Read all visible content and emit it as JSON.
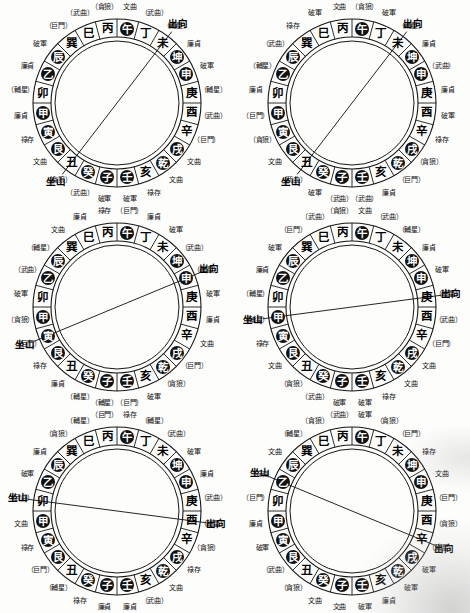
{
  "document": {
    "title": "二十四山九星圖",
    "description": "六個羅盤二十四山九星配置圖"
  },
  "glyphs": {
    "mountains": [
      "壬",
      "子",
      "癸",
      "丑",
      "艮",
      "寅",
      "甲",
      "卯",
      "乙",
      "辰",
      "巽",
      "巳",
      "丙",
      "午",
      "丁",
      "未",
      "坤",
      "申",
      "庚",
      "酉",
      "辛",
      "戌",
      "乾",
      "亥"
    ],
    "filled": [
      "壬",
      "子",
      "癸",
      "艮",
      "寅",
      "甲",
      "乙",
      "辰",
      "坤",
      "申",
      "戌",
      "乾"
    ],
    "hollow": [
      "丑",
      "卯",
      "巽",
      "巳",
      "丙",
      "午",
      "丁",
      "未",
      "庚",
      "酉",
      "辛",
      "亥"
    ],
    "special_filled": [
      "午"
    ]
  },
  "stars": {
    "names": [
      "文曲",
      "武曲",
      "破軍",
      "廉貞",
      "貪狼",
      "巨門",
      "祿存",
      "輔星"
    ],
    "bracket_style": "（ ）"
  },
  "markers": {
    "sitting": "坐山",
    "facing": "出向"
  },
  "diagrams": [
    {
      "id": "diagram-1",
      "position": "top-left",
      "sitting_mountain": "丑",
      "facing_mountain": "未",
      "stars": [
        {
          "m": "壬",
          "label": "破軍",
          "bracket": false
        },
        {
          "m": "子",
          "label": "破軍",
          "bracket": false
        },
        {
          "m": "癸",
          "label": "武曲",
          "bracket": true
        },
        {
          "m": "丑",
          "label": "貪狼",
          "bracket": true
        },
        {
          "m": "艮",
          "label": "文曲",
          "bracket": false
        },
        {
          "m": "寅",
          "label": "祿存",
          "bracket": false
        },
        {
          "m": "甲",
          "label": "廉貞",
          "bracket": false
        },
        {
          "m": "卯",
          "label": "輔星",
          "bracket": true
        },
        {
          "m": "乙",
          "label": "廉貞",
          "bracket": false
        },
        {
          "m": "辰",
          "label": "破軍",
          "bracket": false
        },
        {
          "m": "巽",
          "label": "巨門",
          "bracket": true
        },
        {
          "m": "巳",
          "label": "武曲",
          "bracket": true
        },
        {
          "m": "丙",
          "label": "貪狼",
          "bracket": true
        },
        {
          "m": "午",
          "label": "文曲",
          "bracket": false
        },
        {
          "m": "丁",
          "label": "武曲",
          "bracket": true
        },
        {
          "m": "未",
          "label": "輔星",
          "bracket": true
        },
        {
          "m": "坤",
          "label": "廉貞",
          "bracket": false
        },
        {
          "m": "申",
          "label": "破軍",
          "bracket": false
        },
        {
          "m": "庚",
          "label": "輔星",
          "bracket": true
        },
        {
          "m": "酉",
          "label": "武曲",
          "bracket": true
        },
        {
          "m": "辛",
          "label": "巨門",
          "bracket": true
        },
        {
          "m": "戌",
          "label": "文曲",
          "bracket": false
        },
        {
          "m": "乾",
          "label": "文曲",
          "bracket": false
        },
        {
          "m": "亥",
          "label": "祿存",
          "bracket": false
        }
      ]
    },
    {
      "id": "diagram-2",
      "position": "top-right",
      "sitting_mountain": "丑",
      "facing_mountain": "未",
      "stars": [
        {
          "m": "壬",
          "label": "武曲",
          "bracket": true
        },
        {
          "m": "子",
          "label": "武曲",
          "bracket": true
        },
        {
          "m": "癸",
          "label": "破軍",
          "bracket": false
        },
        {
          "m": "丑",
          "label": "武曲",
          "bracket": true
        },
        {
          "m": "艮",
          "label": "文曲",
          "bracket": false
        },
        {
          "m": "寅",
          "label": "貪狼",
          "bracket": true
        },
        {
          "m": "甲",
          "label": "巨門",
          "bracket": true
        },
        {
          "m": "卯",
          "label": "廉貞",
          "bracket": false
        },
        {
          "m": "乙",
          "label": "輔星",
          "bracket": true
        },
        {
          "m": "辰",
          "label": "武曲",
          "bracket": true
        },
        {
          "m": "巽",
          "label": "祿存",
          "bracket": false
        },
        {
          "m": "巳",
          "label": "破軍",
          "bracket": false
        },
        {
          "m": "丙",
          "label": "文曲",
          "bracket": false
        },
        {
          "m": "午",
          "label": "貪狼",
          "bracket": true
        },
        {
          "m": "丁",
          "label": "破軍",
          "bracket": false
        },
        {
          "m": "未",
          "label": "輔星",
          "bracket": true
        },
        {
          "m": "坤",
          "label": "廉貞",
          "bracket": false
        },
        {
          "m": "申",
          "label": "武曲",
          "bracket": true
        },
        {
          "m": "庚",
          "label": "廉貞",
          "bracket": false
        },
        {
          "m": "酉",
          "label": "破軍",
          "bracket": false
        },
        {
          "m": "辛",
          "label": "祿存",
          "bracket": false
        },
        {
          "m": "戌",
          "label": "貪狼",
          "bracket": true
        },
        {
          "m": "乾",
          "label": "巨門",
          "bracket": true
        },
        {
          "m": "亥",
          "label": "廉貞",
          "bracket": false
        }
      ]
    },
    {
      "id": "diagram-3",
      "position": "mid-left",
      "sitting_mountain": "寅",
      "facing_mountain": "申",
      "stars": [
        {
          "m": "壬",
          "label": "巨門",
          "bracket": true
        },
        {
          "m": "子",
          "label": "輔星",
          "bracket": true
        },
        {
          "m": "癸",
          "label": "輔星",
          "bracket": true
        },
        {
          "m": "丑",
          "label": "廉貞",
          "bracket": false
        },
        {
          "m": "艮",
          "label": "祿存",
          "bracket": false
        },
        {
          "m": "寅",
          "label": "巨門",
          "bracket": true
        },
        {
          "m": "甲",
          "label": "貪狼",
          "bracket": true
        },
        {
          "m": "卯",
          "label": "破軍",
          "bracket": false
        },
        {
          "m": "乙",
          "label": "武曲",
          "bracket": true
        },
        {
          "m": "辰",
          "label": "輔星",
          "bracket": true
        },
        {
          "m": "巽",
          "label": "文曲",
          "bracket": false
        },
        {
          "m": "巳",
          "label": "廉貞",
          "bracket": false
        },
        {
          "m": "丙",
          "label": "祿存",
          "bracket": false
        },
        {
          "m": "午",
          "label": "巨門",
          "bracket": true
        },
        {
          "m": "丁",
          "label": "廉貞",
          "bracket": false
        },
        {
          "m": "未",
          "label": "破軍",
          "bracket": false
        },
        {
          "m": "坤",
          "label": "武曲",
          "bracket": true
        },
        {
          "m": "申",
          "label": "輔星",
          "bracket": true
        },
        {
          "m": "庚",
          "label": "破軍",
          "bracket": false
        },
        {
          "m": "酉",
          "label": "廉貞",
          "bracket": false
        },
        {
          "m": "辛",
          "label": "文曲",
          "bracket": false
        },
        {
          "m": "戌",
          "label": "巨門",
          "bracket": true
        },
        {
          "m": "乾",
          "label": "貪狼",
          "bracket": true
        },
        {
          "m": "亥",
          "label": "破軍",
          "bracket": false
        }
      ]
    },
    {
      "id": "diagram-4",
      "position": "mid-right",
      "sitting_mountain": "甲",
      "facing_mountain": "庚",
      "stars": [
        {
          "m": "壬",
          "label": "破軍",
          "bracket": false
        },
        {
          "m": "子",
          "label": "破軍",
          "bracket": false
        },
        {
          "m": "癸",
          "label": "武曲",
          "bracket": true
        },
        {
          "m": "丑",
          "label": "貪狼",
          "bracket": true
        },
        {
          "m": "艮",
          "label": "文曲",
          "bracket": false
        },
        {
          "m": "寅",
          "label": "祿存",
          "bracket": false
        },
        {
          "m": "甲",
          "label": "輔星",
          "bracket": true
        },
        {
          "m": "卯",
          "label": "輔星",
          "bracket": true
        },
        {
          "m": "乙",
          "label": "廉貞",
          "bracket": false
        },
        {
          "m": "辰",
          "label": "破軍",
          "bracket": false
        },
        {
          "m": "巽",
          "label": "巨門",
          "bracket": true
        },
        {
          "m": "巳",
          "label": "武曲",
          "bracket": true
        },
        {
          "m": "丙",
          "label": "貪狼",
          "bracket": true
        },
        {
          "m": "午",
          "label": "文曲",
          "bracket": false
        },
        {
          "m": "丁",
          "label": "武曲",
          "bracket": true
        },
        {
          "m": "未",
          "label": "輔星",
          "bracket": true
        },
        {
          "m": "坤",
          "label": "廉貞",
          "bracket": false
        },
        {
          "m": "申",
          "label": "破軍",
          "bracket": false
        },
        {
          "m": "庚",
          "label": "輔星",
          "bracket": true
        },
        {
          "m": "酉",
          "label": "武曲",
          "bracket": true
        },
        {
          "m": "辛",
          "label": "巨門",
          "bracket": true
        },
        {
          "m": "戌",
          "label": "文曲",
          "bracket": false
        },
        {
          "m": "乾",
          "label": "文曲",
          "bracket": false
        },
        {
          "m": "亥",
          "label": "祿存",
          "bracket": false
        }
      ]
    },
    {
      "id": "diagram-5",
      "position": "bottom-left",
      "sitting_mountain": "卯",
      "facing_mountain": "酉",
      "stars": [
        {
          "m": "壬",
          "label": "廉貞",
          "bracket": false
        },
        {
          "m": "子",
          "label": "廉貞",
          "bracket": false
        },
        {
          "m": "癸",
          "label": "祿存",
          "bracket": false
        },
        {
          "m": "丑",
          "label": "輔星",
          "bracket": true
        },
        {
          "m": "艮",
          "label": "巨門",
          "bracket": true
        },
        {
          "m": "寅",
          "label": "祿存",
          "bracket": false
        },
        {
          "m": "甲",
          "label": "文曲",
          "bracket": false
        },
        {
          "m": "卯",
          "label": "武曲",
          "bracket": true
        },
        {
          "m": "乙",
          "label": "破軍",
          "bracket": false
        },
        {
          "m": "辰",
          "label": "廉貞",
          "bracket": false
        },
        {
          "m": "巽",
          "label": "貪狼",
          "bracket": true
        },
        {
          "m": "巳",
          "label": "輔星",
          "bracket": true
        },
        {
          "m": "丙",
          "label": "巨門",
          "bracket": true
        },
        {
          "m": "午",
          "label": "祿存",
          "bracket": false
        },
        {
          "m": "丁",
          "label": "輔星",
          "bracket": true
        },
        {
          "m": "未",
          "label": "武曲",
          "bracket": true
        },
        {
          "m": "坤",
          "label": "破軍",
          "bracket": false
        },
        {
          "m": "申",
          "label": "廉貞",
          "bracket": false
        },
        {
          "m": "庚",
          "label": "武曲",
          "bracket": true
        },
        {
          "m": "酉",
          "label": "輔星",
          "bracket": true
        },
        {
          "m": "辛",
          "label": "貪狼",
          "bracket": true
        },
        {
          "m": "戌",
          "label": "祿存",
          "bracket": false
        },
        {
          "m": "乾",
          "label": "文曲",
          "bracket": false
        },
        {
          "m": "亥",
          "label": "武曲",
          "bracket": true
        }
      ]
    },
    {
      "id": "diagram-6",
      "position": "bottom-right",
      "sitting_mountain": "乙",
      "facing_mountain": "辛",
      "stars": [
        {
          "m": "壬",
          "label": "破軍",
          "bracket": false
        },
        {
          "m": "子",
          "label": "文曲",
          "bracket": false
        },
        {
          "m": "癸",
          "label": "文曲",
          "bracket": false
        },
        {
          "m": "丑",
          "label": "貪狼",
          "bracket": true
        },
        {
          "m": "艮",
          "label": "武曲",
          "bracket": true
        },
        {
          "m": "寅",
          "label": "破軍",
          "bracket": false
        },
        {
          "m": "甲",
          "label": "廉貞",
          "bracket": false
        },
        {
          "m": "卯",
          "label": "巨門",
          "bracket": true
        },
        {
          "m": "乙",
          "label": "祿存",
          "bracket": false
        },
        {
          "m": "辰",
          "label": "文曲",
          "bracket": false
        },
        {
          "m": "巽",
          "label": "輔星",
          "bracket": true
        },
        {
          "m": "巳",
          "label": "貪狼",
          "bracket": true
        },
        {
          "m": "丙",
          "label": "武曲",
          "bracket": true
        },
        {
          "m": "午",
          "label": "破軍",
          "bracket": false
        },
        {
          "m": "丁",
          "label": "貪狼",
          "bracket": true
        },
        {
          "m": "未",
          "label": "巨門",
          "bracket": true
        },
        {
          "m": "坤",
          "label": "祿存",
          "bracket": false
        },
        {
          "m": "申",
          "label": "文曲",
          "bracket": false
        },
        {
          "m": "庚",
          "label": "巨門",
          "bracket": true
        },
        {
          "m": "酉",
          "label": "貪狼",
          "bracket": true
        },
        {
          "m": "辛",
          "label": "輔星",
          "bracket": true
        },
        {
          "m": "戌",
          "label": "破軍",
          "bracket": false
        },
        {
          "m": "乾",
          "label": "破軍",
          "bracket": false
        },
        {
          "m": "亥",
          "label": "廉貞",
          "bracket": false
        }
      ]
    }
  ]
}
